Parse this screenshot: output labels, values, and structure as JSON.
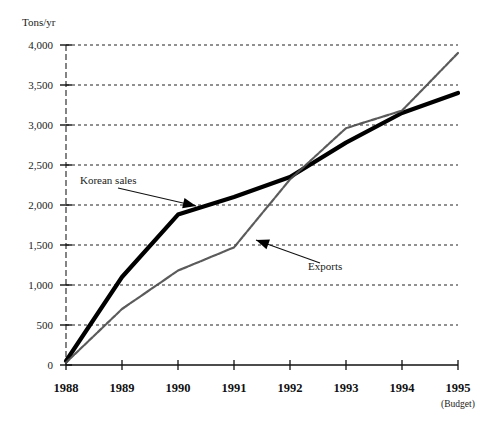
{
  "chart_data": {
    "type": "line",
    "title": "",
    "xlabel": "",
    "ylabel": "Tons/yr",
    "ylim": [
      0,
      4000
    ],
    "grid": true,
    "legend_position": "inline-annotations",
    "categories": [
      "1988",
      "1989",
      "1990",
      "1991",
      "1992",
      "1993",
      "1994",
      "1995"
    ],
    "x_tick_sublabels": [
      "",
      "",
      "",
      "",
      "",
      "",
      "",
      "(Budget)"
    ],
    "y_ticks": [
      0,
      500,
      1000,
      1500,
      2000,
      2500,
      3000,
      3500,
      4000
    ],
    "y_tick_labels": [
      "0",
      "500",
      "1,000",
      "1,500",
      "2,000",
      "2,500",
      "3,000",
      "3,500",
      "4,000"
    ],
    "series": [
      {
        "name": "Korean sales",
        "style": "thick-solid-black",
        "color": "#000000",
        "values": [
          50,
          1100,
          1880,
          2100,
          2350,
          2780,
          3150,
          3400
        ]
      },
      {
        "name": "Exports",
        "style": "thin-speckled-gray",
        "color": "#4d4d4d",
        "values": [
          30,
          700,
          1180,
          1470,
          2320,
          2960,
          3180,
          3900
        ]
      }
    ],
    "annotations": [
      {
        "label": "Korean sales",
        "points_to_series": "Korean sales",
        "arrow_direction": "down-right"
      },
      {
        "label": "Exports",
        "points_to_series": "Exports",
        "arrow_direction": "up-left"
      }
    ]
  },
  "axis": {
    "unit_label": "Tons/yr"
  }
}
